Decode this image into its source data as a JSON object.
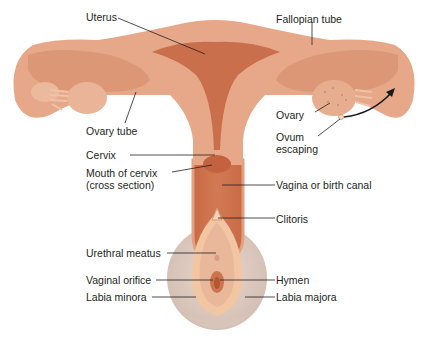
{
  "labels": {
    "uterus": "Uterus",
    "fallopian_tube": "Fallopian tube",
    "ovary_tube": "Ovary tube",
    "ovary": "Ovary",
    "ovum_escaping_1": "Ovum",
    "ovum_escaping_2": "escaping",
    "cervix": "Cervix",
    "mouth_of_cervix_1": "Mouth of cervix",
    "mouth_of_cervix_2": "(cross section)",
    "vagina": "Vagina or birth canal",
    "clitoris": "Clitoris",
    "urethral_meatus": "Urethral meatus",
    "hymen": "Hymen",
    "vaginal_orifice": "Vaginal orifice",
    "labia_minora": "Labia minora",
    "labia_majora": "Labia majora"
  },
  "colors": {
    "tissue_outer": "#e7a88a",
    "tissue_inner": "#d98a66",
    "cavity": "#c66a48",
    "vulva_outer": "#dcc9bf",
    "labia_minora": "#f3c9a6",
    "leader_line": "#231f20"
  }
}
